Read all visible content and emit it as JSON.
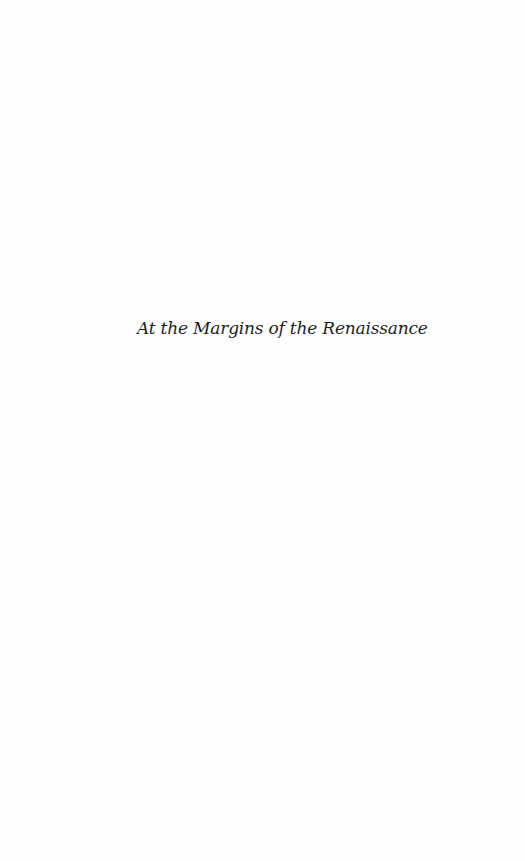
{
  "page": {
    "type": "half-title",
    "title": "At the Margins of the Renaissance",
    "background_color": "#fefefe",
    "text_color": "#1e1e1e"
  }
}
